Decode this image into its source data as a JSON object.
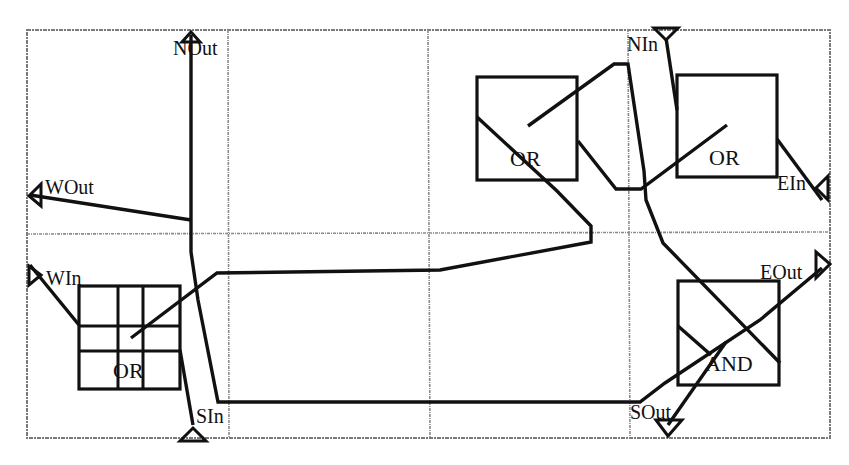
{
  "diagram": {
    "colors": {
      "ink": "#111111",
      "grid": "#8a8a8a",
      "background": "#ffffff"
    },
    "grid": {
      "border": {
        "x1": 27,
        "y1": 30,
        "x2": 830,
        "y2": 438
      },
      "vertical_lines": [
        228,
        428,
        628
      ],
      "horizontal_lines": [
        233
      ]
    },
    "ports": {
      "n_out": {
        "label": "NOut",
        "icon": "up-arrow-icon"
      },
      "w_out": {
        "label": "WOut",
        "icon": "left-arrow-icon"
      },
      "w_in": {
        "label": "WIn",
        "icon": "left-triangle-icon"
      },
      "s_in": {
        "label": "SIn",
        "icon": "up-triangle-icon"
      },
      "n_in": {
        "label": "NIn",
        "icon": "down-triangle-icon"
      },
      "e_in": {
        "label": "EIn",
        "icon": "right-triangle-icon"
      },
      "e_out": {
        "label": "EOut",
        "icon": "right-arrow-icon"
      },
      "s_out": {
        "label": "SOut",
        "icon": "down-arrow-icon"
      }
    },
    "gates": [
      {
        "id": "grid-or",
        "label": "OR",
        "type": "OR",
        "x": 79,
        "y": 286,
        "w": 101,
        "h": 103
      },
      {
        "id": "or-1",
        "label": "OR",
        "type": "OR",
        "x": 477,
        "y": 77,
        "w": 100,
        "h": 103
      },
      {
        "id": "or-2",
        "label": "OR",
        "type": "OR",
        "x": 677,
        "y": 75,
        "w": 100,
        "h": 102
      },
      {
        "id": "and-1",
        "label": "AND",
        "type": "AND",
        "x": 678,
        "y": 281,
        "w": 101,
        "h": 104
      }
    ]
  }
}
